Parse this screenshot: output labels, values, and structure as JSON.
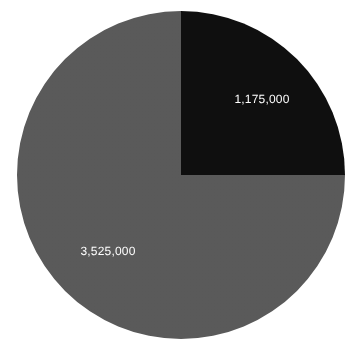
{
  "canvas": {
    "width": 363,
    "height": 350,
    "background_color": "#ffffff"
  },
  "geometry": {
    "center_x": 181,
    "center_y": 175,
    "radius": 164
  },
  "chart_data": {
    "type": "pie",
    "title": "",
    "subtitle": "",
    "xlabel": "",
    "ylabel": "",
    "grid": false,
    "legend_position": "none",
    "total": 4700000,
    "start_angle_deg": 0,
    "direction": "clockwise",
    "categories": [
      "1,175,000",
      "3,525,000"
    ],
    "values": [
      1175000,
      3525000
    ],
    "labels": [
      "1,175,000",
      "3,525,000"
    ],
    "percentages": [
      25,
      75
    ],
    "colors": [
      "#0f0f0f",
      "#5a5a5a"
    ],
    "slices": [
      {
        "label": "1,175,000",
        "value": 1175000,
        "percent": 25,
        "color": "#0f0f0f",
        "start_angle_deg": 0,
        "end_angle_deg": 90,
        "label_x": 262,
        "label_y": 99,
        "label_color": "#ffffff"
      },
      {
        "label": "3,525,000",
        "value": 3525000,
        "percent": 75,
        "color": "#5a5a5a",
        "start_angle_deg": 90,
        "end_angle_deg": 360,
        "label_x": 108,
        "label_y": 251,
        "label_color": "#ffffff"
      }
    ]
  }
}
